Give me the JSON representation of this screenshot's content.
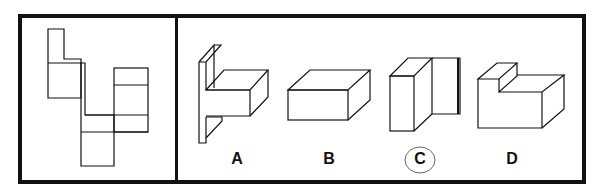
{
  "puzzle": {
    "question_net": "unfolded-net",
    "options": [
      {
        "id": "A",
        "label": "A",
        "selected": false
      },
      {
        "id": "B",
        "label": "B",
        "selected": false
      },
      {
        "id": "C",
        "label": "C",
        "selected": true
      },
      {
        "id": "D",
        "label": "D",
        "selected": false
      }
    ],
    "colors": {
      "line": "#111111",
      "circle": "#555555"
    }
  }
}
